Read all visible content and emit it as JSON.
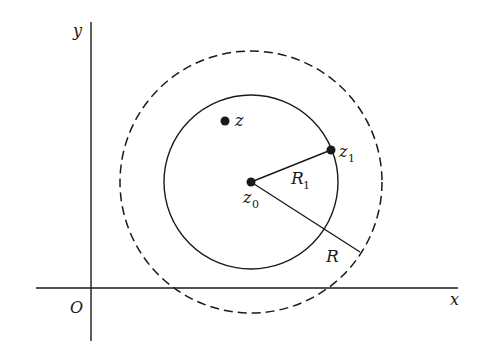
{
  "diagram": {
    "axes": {
      "x_label": "x",
      "y_label": "y",
      "origin_label": "O"
    },
    "points": {
      "z": {
        "label": "z"
      },
      "z0": {
        "label": "z",
        "subscript": "0"
      },
      "z1": {
        "label": "z",
        "subscript": "1"
      }
    },
    "radii": {
      "R1": {
        "label": "R",
        "subscript": "1"
      },
      "R": {
        "label": "R"
      }
    },
    "circles": {
      "inner": {
        "style": "solid",
        "center": "z0",
        "radius_label": "R1"
      },
      "outer": {
        "style": "dashed",
        "center": "z0",
        "radius_label": "R"
      }
    },
    "colors": {
      "stroke": "#1a1a1a",
      "background": "#ffffff"
    }
  }
}
